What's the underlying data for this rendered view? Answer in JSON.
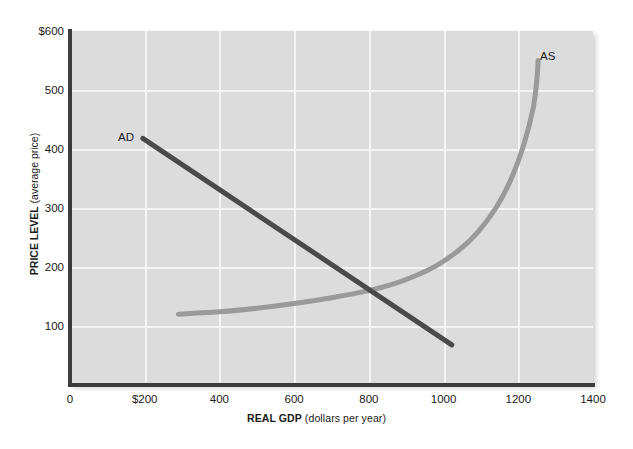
{
  "chart_data": {
    "type": "line",
    "title": "",
    "xlabel_bold": "REAL GDP",
    "xlabel_rest": " (dollars per year)",
    "ylabel_bold": "PRICE LEVEL",
    "ylabel_rest": " (average price)",
    "xlim": [
      0,
      1400
    ],
    "ylim": [
      0,
      600
    ],
    "xticks": [
      "0",
      "$200",
      "400",
      "600",
      "800",
      "1000",
      "1200",
      "1400"
    ],
    "xtick_values": [
      0,
      200,
      400,
      600,
      800,
      1000,
      1200,
      1400
    ],
    "yticks": [
      "$600",
      "500",
      "400",
      "300",
      "200",
      "100"
    ],
    "ytick_values": [
      600,
      500,
      400,
      300,
      200,
      100
    ],
    "grid": true,
    "grid_color": "#f4f4f4",
    "plot_background": "#dcdcdc",
    "legend": "none",
    "annotations": [
      {
        "name": "AD",
        "text": "AD",
        "x": 170,
        "y": 420
      },
      {
        "name": "AS",
        "text": "AS",
        "x": 1280,
        "y": 548
      }
    ],
    "series": [
      {
        "name": "AD",
        "label": "AD",
        "kind": "aggregate-demand",
        "color": "#4a4a4a",
        "linewidth": 5,
        "points": [
          {
            "x": 195,
            "y": 418
          },
          {
            "x": 1022,
            "y": 68
          }
        ]
      },
      {
        "name": "AS",
        "label": "AS",
        "kind": "aggregate-supply",
        "color": "#9a9a9a",
        "linewidth": 5,
        "points": [
          {
            "x": 290,
            "y": 120
          },
          {
            "x": 400,
            "y": 124
          },
          {
            "x": 500,
            "y": 130
          },
          {
            "x": 600,
            "y": 138
          },
          {
            "x": 700,
            "y": 148
          },
          {
            "x": 800,
            "y": 160
          },
          {
            "x": 860,
            "y": 170
          },
          {
            "x": 920,
            "y": 184
          },
          {
            "x": 980,
            "y": 202
          },
          {
            "x": 1040,
            "y": 228
          },
          {
            "x": 1090,
            "y": 258
          },
          {
            "x": 1140,
            "y": 300
          },
          {
            "x": 1180,
            "y": 348
          },
          {
            "x": 1215,
            "y": 408
          },
          {
            "x": 1240,
            "y": 470
          },
          {
            "x": 1250,
            "y": 520
          },
          {
            "x": 1253,
            "y": 550
          }
        ]
      }
    ],
    "equilibrium": {
      "x": 800,
      "y": 158
    }
  }
}
